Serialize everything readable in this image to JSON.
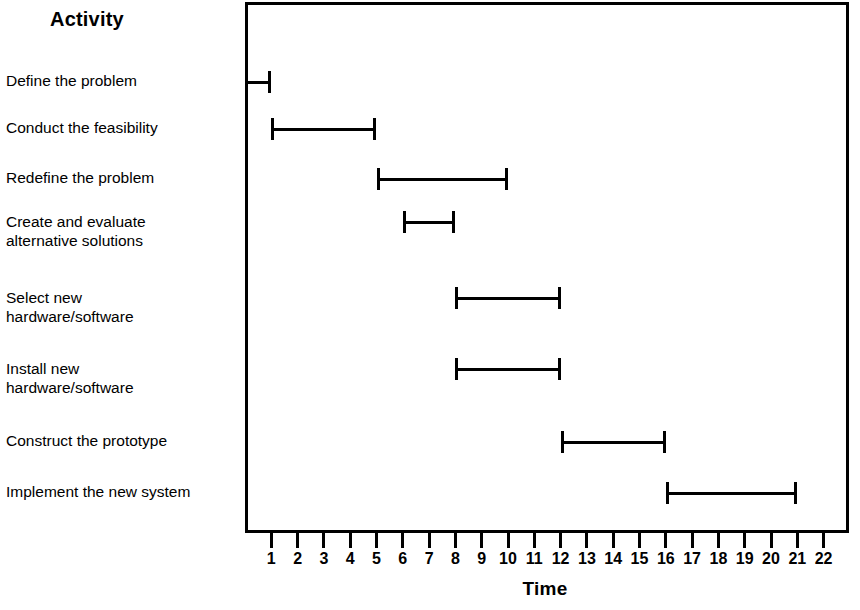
{
  "chart_data": {
    "type": "bar",
    "chart_kind": "gantt",
    "title": "",
    "xlabel": "Time",
    "ylabel": "Activity",
    "xlim": [
      0,
      22.5
    ],
    "xticks": [
      1,
      2,
      3,
      4,
      5,
      6,
      7,
      8,
      9,
      10,
      11,
      12,
      13,
      14,
      15,
      16,
      17,
      18,
      19,
      20,
      21,
      22
    ],
    "xtick_labels": [
      "1",
      "2",
      "3",
      "4",
      "5",
      "6",
      "7",
      "8",
      "9",
      "10",
      "11",
      "12",
      "13",
      "14",
      "15",
      "16",
      "17",
      "18",
      "19",
      "20",
      "21",
      "22"
    ],
    "grid": false,
    "legend": false,
    "frame": true,
    "categories": [
      "Define the problem",
      "Conduct the feasibility",
      "Redefine the problem",
      "Create and evaluate\nalternative solutions",
      "Select new\nhardware/software",
      "Install new\nhardware/software",
      "Construct the prototype",
      "Implement the new system"
    ],
    "tasks": [
      {
        "label": "Define the problem",
        "start": 0,
        "end": 1,
        "duration": 1
      },
      {
        "label": "Conduct the feasibility",
        "start": 1,
        "end": 5,
        "duration": 4
      },
      {
        "label": "Redefine the problem",
        "start": 5,
        "end": 10,
        "duration": 5
      },
      {
        "label": "Create and evaluate\nalternative solutions",
        "start": 6,
        "end": 8,
        "duration": 2
      },
      {
        "label": "Select new\nhardware/software",
        "start": 8,
        "end": 12,
        "duration": 4
      },
      {
        "label": "Install new\nhardware/software",
        "start": 8,
        "end": 12,
        "duration": 4
      },
      {
        "label": "Construct the prototype",
        "start": 12,
        "end": 16,
        "duration": 4
      },
      {
        "label": "Implement the new system",
        "start": 16,
        "end": 21,
        "duration": 5
      }
    ],
    "bar_style": "I-beam",
    "colors": {
      "bar": "#000000",
      "frame": "#000000",
      "background": "#ffffff",
      "text": "#000000"
    }
  },
  "header": {
    "activity_title": "Activity"
  },
  "axis": {
    "time_title": "Time"
  },
  "labels": {
    "items": [
      {
        "text": "Define the problem",
        "top": 71,
        "row_center": 82
      },
      {
        "text": "Conduct the feasibility",
        "top": 118,
        "row_center": 129
      },
      {
        "text": "Redefine the problem",
        "top": 168,
        "row_center": 179
      },
      {
        "text": "Create and evaluate\nalternative solutions",
        "top": 212,
        "row_center": 222
      },
      {
        "text": "Select new\nhardware/software",
        "top": 288,
        "row_center": 298
      },
      {
        "text": "Install new\nhardware/software",
        "top": 359,
        "row_center": 369
      },
      {
        "text": "Construct the prototype",
        "top": 431,
        "row_center": 442
      },
      {
        "text": "Implement the new system",
        "top": 482,
        "row_center": 493
      }
    ]
  }
}
